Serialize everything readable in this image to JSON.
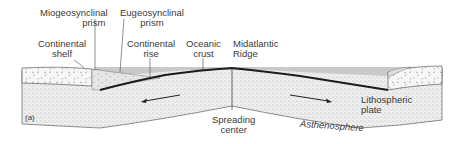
{
  "figure": {
    "panel_label": "(a)",
    "labels": {
      "miogeosynclinal_prism": [
        "Miogeosynclinal",
        "prism"
      ],
      "eugeosynclinal_prism": [
        "Eugeosynclinal",
        "prism"
      ],
      "continental_shelf": [
        "Continental",
        "shelf"
      ],
      "continental_rise": [
        "Continental",
        "rise"
      ],
      "oceanic_crust": [
        "Oceanic",
        "crust"
      ],
      "midatlantic_ridge": [
        "Midatlantic",
        "Ridge"
      ],
      "lithospheric_plate": [
        "Lithospheric",
        "plate"
      ],
      "spreading_center": [
        "Spreading",
        "center"
      ],
      "asthenosphere": "Asthenosphere"
    },
    "colors": {
      "ink": "#2a2a2a",
      "water": "#c9c9c9",
      "stipple_bg": "#efefef",
      "crust_bg": "#f4f4f4"
    }
  }
}
